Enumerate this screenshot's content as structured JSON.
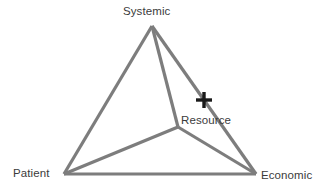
{
  "diagram": {
    "type": "triangle-network-diagram",
    "background_color": "#ffffff",
    "edge_color": "#7d7d7d",
    "edge_width": 3.2,
    "marker_color": "#1a1a1a",
    "label_color": "#3b3b3b",
    "vertices": {
      "systemic": {
        "label": "Systemic",
        "x": 152,
        "y": 26
      },
      "patient": {
        "label": "Patient",
        "x": 64,
        "y": 174
      },
      "economic": {
        "label": "Economic",
        "x": 256,
        "y": 174
      }
    },
    "interior_node": {
      "label": "Resource",
      "x": 178,
      "y": 127
    },
    "marker": {
      "name": "plus-marker",
      "x": 204,
      "y": 100,
      "arm_length": 8,
      "thickness": 3.4
    },
    "edges": [
      {
        "from": "systemic",
        "to": "patient"
      },
      {
        "from": "systemic",
        "to": "economic"
      },
      {
        "from": "patient",
        "to": "economic"
      },
      {
        "from": "systemic",
        "to": "resource"
      },
      {
        "from": "patient",
        "to": "resource"
      },
      {
        "from": "economic",
        "to": "resource"
      }
    ]
  }
}
